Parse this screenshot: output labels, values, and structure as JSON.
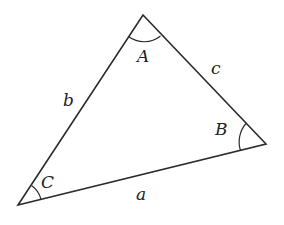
{
  "diagram": {
    "title": "",
    "stroke_color": "#2a2a2a",
    "vertices": [
      {
        "id": "A",
        "x": 143,
        "y": 15
      },
      {
        "id": "B",
        "x": 266,
        "y": 144
      },
      {
        "id": "C",
        "x": 18,
        "y": 205
      }
    ],
    "angle_labels": [
      {
        "text": "A",
        "x": 143,
        "y": 62
      },
      {
        "text": "B",
        "x": 226,
        "y": 135
      },
      {
        "text": "C",
        "x": 51,
        "y": 188
      }
    ],
    "side_labels": [
      {
        "text": "c",
        "x": 216,
        "y": 76
      },
      {
        "text": "b",
        "x": 68,
        "y": 106
      },
      {
        "text": "a",
        "x": 141,
        "y": 200
      }
    ]
  }
}
